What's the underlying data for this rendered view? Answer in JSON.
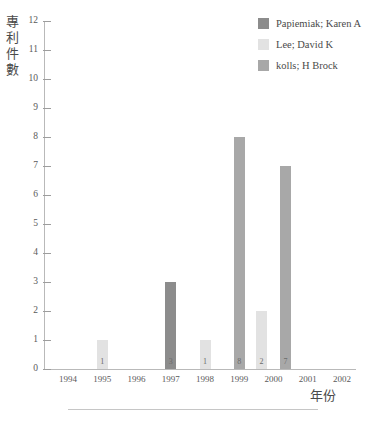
{
  "chart_data": {
    "type": "bar",
    "title": "",
    "xlabel": "年份",
    "ylabel": "專利件數",
    "categories": [
      "1994",
      "1995",
      "1996",
      "1997",
      "1998",
      "1999",
      "2000",
      "2001",
      "2002"
    ],
    "ylim": [
      0,
      12
    ],
    "ytick_step": 1,
    "yticks": [
      "0",
      "1",
      "2",
      "3",
      "4",
      "5",
      "6",
      "7",
      "8",
      "9",
      "10",
      "11",
      "12"
    ],
    "grid": false,
    "legend_position": "top-right",
    "series": [
      {
        "name": "Papiemiak; Karen A",
        "color": "#8c8c8c",
        "values": [
          0,
          0,
          0,
          3,
          0,
          0,
          0,
          0,
          0
        ]
      },
      {
        "name": "Lee; David K",
        "color": "#e2e2e2",
        "values": [
          0,
          1,
          0,
          0,
          1,
          0,
          2,
          0,
          0
        ]
      },
      {
        "name": "kolls; H Brock",
        "color": "#a8a8a8",
        "values": [
          0,
          0,
          0,
          0,
          0,
          8,
          7,
          0,
          0
        ]
      }
    ],
    "bars": [
      {
        "year": "1995",
        "series": "Lee; David K",
        "value": 1,
        "label": "1",
        "color": "#e2e2e2",
        "slot": 0
      },
      {
        "year": "1997",
        "series": "Papiemiak; Karen A",
        "value": 3,
        "label": "3",
        "color": "#8c8c8c",
        "slot": 0
      },
      {
        "year": "1998",
        "series": "Lee; David K",
        "value": 1,
        "label": "1",
        "color": "#e2e2e2",
        "slot": 0
      },
      {
        "year": "1999",
        "series": "kolls; H Brock",
        "value": 8,
        "label": "8",
        "color": "#a8a8a8",
        "slot": 0
      },
      {
        "year": "2000",
        "series": "Lee; David K",
        "value": 2,
        "label": "2",
        "color": "#e2e2e2",
        "slot": -1
      },
      {
        "year": "2000",
        "series": "kolls; H Brock",
        "value": 7,
        "label": "7",
        "color": "#a8a8a8",
        "slot": 1
      }
    ]
  },
  "legend": {
    "items": [
      {
        "label": "Papiemiak; Karen A",
        "color": "#8c8c8c"
      },
      {
        "label": "Lee; David K",
        "color": "#e2e2e2"
      },
      {
        "label": "kolls; H Brock",
        "color": "#a8a8a8"
      }
    ]
  },
  "y_axis_title_chars": [
    "專",
    "利",
    "件",
    "數"
  ]
}
